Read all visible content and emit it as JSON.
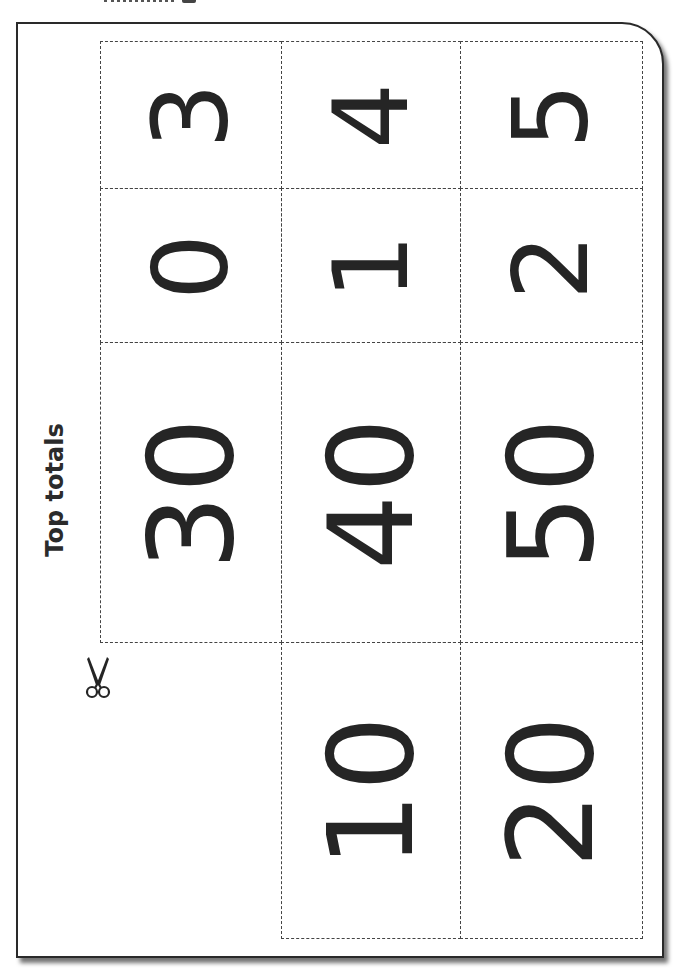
{
  "page": {
    "title": "Top totals",
    "accent_color": "#252525"
  },
  "cards": {
    "row1": [
      "3",
      "4",
      "5"
    ],
    "row2": [
      "0",
      "1",
      "2"
    ],
    "row3": [
      "30",
      "40",
      "50"
    ],
    "row4": [
      "10",
      "20"
    ]
  },
  "icons": {
    "cut": "scissors-icon"
  }
}
